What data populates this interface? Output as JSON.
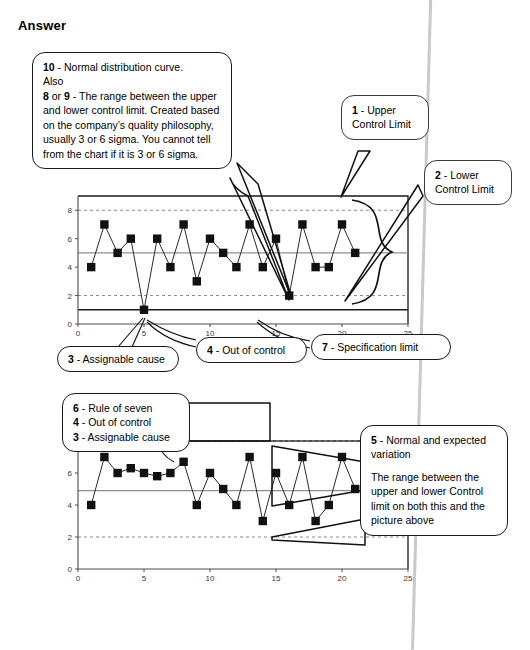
{
  "page": {
    "heading": "Answer"
  },
  "callouts": {
    "note_10": {
      "line1_num": "10",
      "line1_text": " - Normal distribution curve.",
      "line2_text": "Also",
      "line3_a": "8",
      "line3_mid": " or ",
      "line3_b": "9",
      "line3_text": " - The range between the upper and lower control limit. Created based on the company’s quality philosophy, usually 3 or 6 sigma. You cannot tell from the chart if it is 3 or 6 sigma."
    },
    "note_1": {
      "num": "1",
      "text": " - Upper Control Limit"
    },
    "note_2": {
      "num": "2",
      "text": " - Lower Control Limit"
    },
    "note_3": {
      "num": "3",
      "text": " - Assignable cause"
    },
    "note_4": {
      "num": "4",
      "text": " - Out of control"
    },
    "note_7": {
      "num": "7",
      "text": " - Specification limit"
    },
    "note_group_2": {
      "l1_num": "6",
      "l1_text": " - Rule of seven",
      "l2_num": "4",
      "l2_text": " - Out of control",
      "l3_num": "3",
      "l3_text": " - Assignable cause"
    },
    "note_5": {
      "num": "5",
      "title": " - Normal and expected variation",
      "body": "The range between the upper and lower Control limit on both this and the picture above"
    }
  },
  "chart_data": [
    {
      "type": "line",
      "title": "Control chart (upper)",
      "xlabel": "",
      "ylabel": "",
      "xlim": [
        0,
        25
      ],
      "ylim": [
        0,
        9
      ],
      "xticks": [
        0,
        5,
        10,
        15,
        20,
        25
      ],
      "yticks": [
        0,
        2,
        4,
        6,
        8
      ],
      "grid": true,
      "gridlines_dashed_y": [
        2,
        8
      ],
      "upper_control_limit": 8,
      "lower_control_limit": 2,
      "center_line": 5,
      "specification_limit": 1,
      "legend": "none",
      "x": [
        1,
        2,
        3,
        4,
        5,
        6,
        7,
        8,
        9,
        10,
        11,
        12,
        13,
        14,
        15,
        16,
        17,
        18,
        19,
        20,
        21
      ],
      "values": [
        4,
        7,
        5,
        6,
        1,
        6,
        4,
        7,
        3,
        6,
        5,
        4,
        7,
        4,
        6,
        2,
        7,
        4,
        4,
        7,
        5
      ]
    },
    {
      "type": "line",
      "title": "Control chart (lower)",
      "xlabel": "",
      "ylabel": "",
      "xlim": [
        0,
        25
      ],
      "ylim": [
        0,
        8
      ],
      "xticks": [
        0,
        5,
        10,
        15,
        20,
        25
      ],
      "yticks": [
        0,
        2,
        4,
        6
      ],
      "grid": true,
      "gridlines_dashed_y": [
        2,
        8
      ],
      "upper_control_limit": 8,
      "lower_control_limit": 2,
      "center_line": 4.9,
      "legend": "none",
      "x": [
        1,
        2,
        3,
        4,
        5,
        6,
        7,
        8,
        9,
        10,
        11,
        12,
        13,
        14,
        15,
        16,
        17,
        18,
        19,
        20,
        21
      ],
      "values": [
        4,
        7,
        6,
        6.3,
        6,
        5.8,
        6,
        6.7,
        4,
        6,
        5,
        4,
        7,
        3,
        6,
        4,
        7,
        3,
        4,
        7,
        5
      ]
    }
  ]
}
